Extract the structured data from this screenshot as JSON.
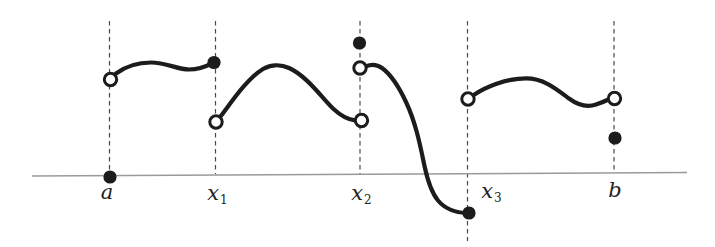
{
  "figure": {
    "colors": {
      "background": "#ffffff",
      "curve": "#1c1c1c",
      "axis": "#9a9a9a",
      "guide": "#4a4a4a",
      "label": "#222222"
    },
    "axis": {
      "x1": 32,
      "y1": 176,
      "x2": 687,
      "y2": 172.5
    },
    "guides": [
      {
        "id": "a",
        "x": 109.5,
        "y1": 21,
        "y2": 171
      },
      {
        "id": "x1",
        "x": 215.5,
        "y1": 21,
        "y2": 174
      },
      {
        "id": "x2",
        "x": 360,
        "y1": 21,
        "y2": 174
      },
      {
        "id": "x3",
        "x": 467.5,
        "y1": 21,
        "y2": 241
      },
      {
        "id": "b",
        "x": 614,
        "y1": 21,
        "y2": 173
      }
    ],
    "labels": [
      {
        "id": "a",
        "base": "a",
        "sub": "",
        "x": 107,
        "y": 192
      },
      {
        "id": "x1",
        "base": "x",
        "sub": "1",
        "x": 217,
        "y": 193
      },
      {
        "id": "x2",
        "base": "x",
        "sub": "2",
        "x": 361,
        "y": 193
      },
      {
        "id": "x3",
        "base": "x",
        "sub": "3",
        "x": 491,
        "y": 191
      },
      {
        "id": "b",
        "base": "b",
        "sub": "",
        "x": 615,
        "y": 190
      }
    ],
    "markers": {
      "open": [
        {
          "at": "a",
          "x": 110.5,
          "y": 79.5
        },
        {
          "at": "x1",
          "x": 216,
          "y": 122
        },
        {
          "at": "x2-upper",
          "x": 360,
          "y": 68
        },
        {
          "at": "x2-lower",
          "x": 361.5,
          "y": 120.5
        },
        {
          "at": "x3",
          "x": 468,
          "y": 99
        },
        {
          "at": "b",
          "x": 614.5,
          "y": 98.5
        }
      ],
      "filled": [
        {
          "at": "a-on-axis",
          "x": 110,
          "y": 177
        },
        {
          "at": "x1-value",
          "x": 214,
          "y": 62.5
        },
        {
          "at": "x2-value",
          "x": 359.5,
          "y": 43
        },
        {
          "at": "x3-value",
          "x": 469,
          "y": 213
        },
        {
          "at": "b-value",
          "x": 615,
          "y": 138
        }
      ]
    }
  }
}
